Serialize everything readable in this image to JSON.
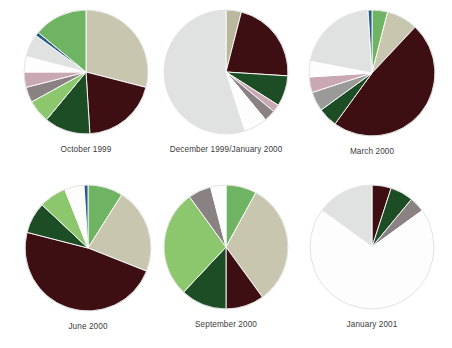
{
  "figure": {
    "background": "#ffffff",
    "layout": "2 rows x 3 columns of pie charts"
  },
  "palette": {
    "dark_maroon": "#3d0f12",
    "beige": "#c8c6ae",
    "medium_green": "#6fb463",
    "light_green": "#8cc76e",
    "dark_green": "#1d4d24",
    "forest_green": "#22592c",
    "light_gray": "#dfe2e0",
    "white": "#fdfdfd",
    "pink_mauve": "#c9a8b4",
    "gray_brown": "#8a8183",
    "gray": "#9a9a98",
    "blue": "#2a5c8a",
    "olive": "#b9b79c"
  },
  "chart_data": [
    {
      "type": "pie",
      "title": "October 1999",
      "start_angle": -90,
      "direction": "clockwise",
      "radius": 62,
      "labels": [
        "Beige",
        "Dark maroon",
        "Dark green",
        "Light green",
        "Gray brown",
        "Pink mauve",
        "White",
        "Light gray",
        "Blue",
        "Medium green"
      ],
      "values": [
        29,
        20,
        12,
        6,
        4,
        4,
        4,
        6,
        1,
        14
      ],
      "colors": [
        "#c8c6ae",
        "#3d0f12",
        "#1d4d24",
        "#8cc76e",
        "#8a8183",
        "#c9a8b4",
        "#fdfdfd",
        "#dfe2e0",
        "#2a5c8a",
        "#6fb463"
      ],
      "total": 100
    },
    {
      "type": "pie",
      "title": "December 1999/January 2000",
      "start_angle": -90,
      "direction": "clockwise",
      "radius": 62,
      "labels": [
        "Olive",
        "Dark maroon",
        "Dark green",
        "Pink mauve",
        "Gray brown",
        "White",
        "Light gray"
      ],
      "values": [
        4,
        22,
        8,
        2,
        3,
        6,
        55
      ],
      "colors": [
        "#b9b79c",
        "#3d0f12",
        "#1d4d24",
        "#c9a8b4",
        "#8a8183",
        "#fdfdfd",
        "#dfe2e0"
      ],
      "total": 100
    },
    {
      "type": "pie",
      "title": "March 2000",
      "start_angle": -90,
      "direction": "clockwise",
      "radius": 63,
      "labels": [
        "Medium green",
        "Beige",
        "Dark maroon",
        "Dark green",
        "Gray",
        "Pink mauve",
        "White",
        "Light gray",
        "Blue"
      ],
      "values": [
        4,
        8,
        48,
        5,
        5,
        4,
        4,
        21,
        1
      ],
      "colors": [
        "#6fb463",
        "#c8c6ae",
        "#3d0f12",
        "#1d4d24",
        "#9a9a98",
        "#c9a8b4",
        "#fdfdfd",
        "#dfe2e0",
        "#2a5c8a"
      ],
      "total": 100
    },
    {
      "type": "pie",
      "title": "June 2000",
      "start_angle": -90,
      "direction": "clockwise",
      "radius": 63,
      "labels": [
        "Medium green",
        "Beige",
        "Dark maroon",
        "Dark green",
        "Light green",
        "White",
        "Blue"
      ],
      "values": [
        9,
        22,
        48,
        8,
        7,
        5,
        1
      ],
      "colors": [
        "#6fb463",
        "#c8c6ae",
        "#3d0f12",
        "#1d4d24",
        "#8cc76e",
        "#fdfdfd",
        "#2a5c8a"
      ],
      "total": 100
    },
    {
      "type": "pie",
      "title": "September 2000",
      "start_angle": -90,
      "direction": "clockwise",
      "radius": 62,
      "labels": [
        "Medium green",
        "Beige",
        "Dark maroon",
        "Dark green",
        "Light green",
        "Gray",
        "White"
      ],
      "values": [
        8,
        32,
        10,
        12,
        28,
        6,
        4
      ],
      "colors": [
        "#6fb463",
        "#c8c6ae",
        "#3d0f12",
        "#1d4d24",
        "#8cc76e",
        "#8a8183",
        "#fdfdfd"
      ],
      "total": 100
    },
    {
      "type": "pie",
      "title": "January 2001",
      "start_angle": -90,
      "direction": "clockwise",
      "radius": 62,
      "labels": [
        "Dark maroon",
        "Dark green",
        "Gray brown",
        "White",
        "Light gray"
      ],
      "values": [
        5,
        6,
        4,
        70,
        15
      ],
      "colors": [
        "#3d0f12",
        "#1d4d24",
        "#8a8183",
        "#fdfdfd",
        "#dfe2e0"
      ],
      "total": 100
    }
  ]
}
